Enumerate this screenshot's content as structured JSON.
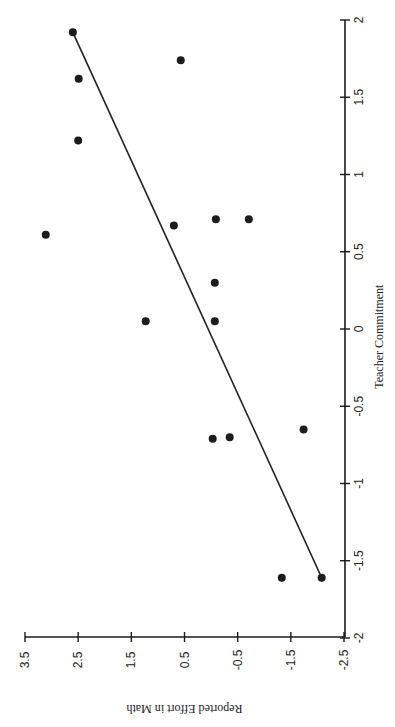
{
  "chart_data": {
    "type": "scatter",
    "orientation_note_visible": "figure rotated 90 degrees clockwise on page",
    "title": "",
    "xlabel": "Teacher Commitment",
    "ylabel": "Reported Effort in Math",
    "xlim": [
      -2,
      2
    ],
    "ylim": [
      -2.5,
      3.5
    ],
    "x_ticks": [
      "-2",
      "-1.5",
      "-1",
      "-0.5",
      "0",
      "0.5",
      "1",
      "1.5",
      "2"
    ],
    "y_ticks": [
      "-2.5",
      "-1.5",
      "-0.5",
      "0.5",
      "1.5",
      "2.5",
      "3.5"
    ],
    "grid": false,
    "legend": null,
    "series": [
      {
        "name": "Teachers",
        "points": [
          {
            "x": 1.92,
            "y": 2.6
          },
          {
            "x": 1.62,
            "y": 2.49
          },
          {
            "x": 1.22,
            "y": 2.5
          },
          {
            "x": 1.74,
            "y": 0.57
          },
          {
            "x": 0.61,
            "y": 3.11
          },
          {
            "x": 0.67,
            "y": 0.7
          },
          {
            "x": 0.71,
            "y": -0.09
          },
          {
            "x": 0.71,
            "y": -0.71
          },
          {
            "x": 0.3,
            "y": -0.07
          },
          {
            "x": 0.05,
            "y": 1.23
          },
          {
            "x": 0.05,
            "y": -0.07
          },
          {
            "x": -0.71,
            "y": -0.03
          },
          {
            "x": -0.7,
            "y": -0.35
          },
          {
            "x": -0.65,
            "y": -1.74
          },
          {
            "x": -1.61,
            "y": -1.33
          },
          {
            "x": -1.61,
            "y": -2.08
          }
        ]
      }
    ],
    "fit_line": {
      "x0": -1.61,
      "y0": -2.08,
      "x1": 1.92,
      "y1": 2.6
    }
  },
  "layout": {
    "x_axis_px": {
      "at_min": 638,
      "at_max": 20
    },
    "y_axis_px": {
      "at_min": 344,
      "at_max": 25
    },
    "x_axis_line_px": 345,
    "y_axis_line_px": 637,
    "colors": {
      "ink": "#1c1c1c",
      "background": "#ffffff"
    }
  }
}
